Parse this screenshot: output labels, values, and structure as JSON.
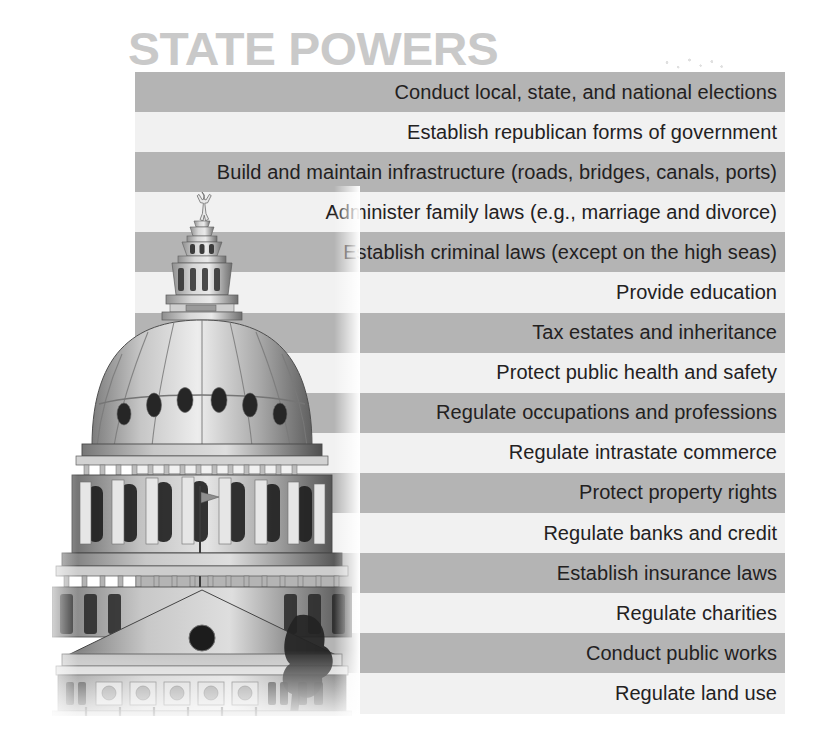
{
  "page": {
    "title": "STATE POWERS",
    "background_color": "#ffffff"
  },
  "colors": {
    "title_text": "#c9c9c9",
    "stripe_dark": "#b4b4b4",
    "stripe_light": "#f1f1f1",
    "row_text": "#23211f"
  },
  "illustration": {
    "name": "texas-state-capitol-dome",
    "description": "Grayscale photograph of the Texas State Capitol dome topped by the Goddess of Liberty statue",
    "alt": "State capitol building dome"
  },
  "list": {
    "name": "state-powers-list",
    "alignment": "right",
    "items": [
      {
        "label": "Conduct local, state, and national elections",
        "stripe": "dark"
      },
      {
        "label": "Establish republican forms of government",
        "stripe": "light"
      },
      {
        "label": "Build and maintain infrastructure (roads, bridges, canals, ports)",
        "stripe": "dark"
      },
      {
        "label": "Administer family laws (e.g., marriage and divorce)",
        "stripe": "light"
      },
      {
        "label": "Establish criminal laws (except on the high seas)",
        "stripe": "dark"
      },
      {
        "label": "Provide education",
        "stripe": "light"
      },
      {
        "label": "Tax estates and inheritance",
        "stripe": "dark"
      },
      {
        "label": "Protect public health and safety",
        "stripe": "light"
      },
      {
        "label": "Regulate occupations and professions",
        "stripe": "dark"
      },
      {
        "label": "Regulate intrastate commerce",
        "stripe": "light"
      },
      {
        "label": "Protect property rights",
        "stripe": "dark"
      },
      {
        "label": "Regulate banks and credit",
        "stripe": "light"
      },
      {
        "label": "Establish insurance laws",
        "stripe": "dark"
      },
      {
        "label": "Regulate charities",
        "stripe": "light"
      },
      {
        "label": "Conduct public works",
        "stripe": "dark"
      },
      {
        "label": "Regulate land use",
        "stripe": "light"
      }
    ]
  }
}
